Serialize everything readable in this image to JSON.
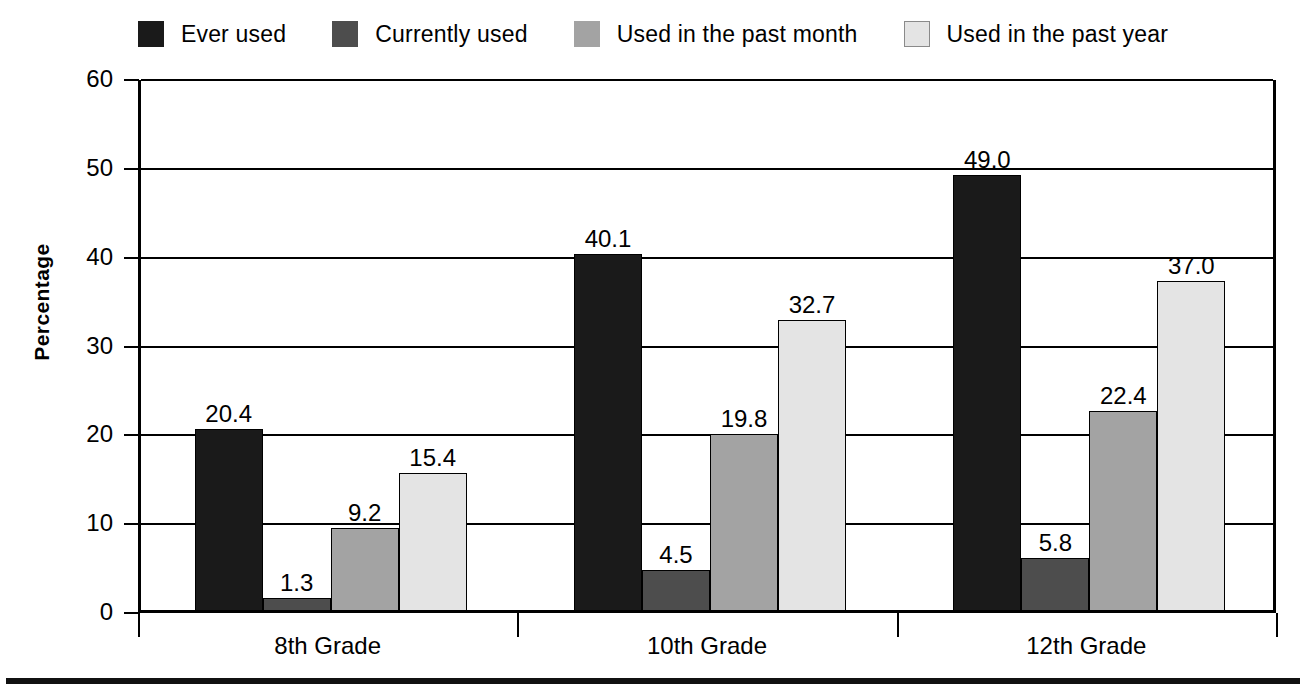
{
  "chart_data": {
    "type": "bar",
    "title": "",
    "xlabel": "",
    "ylabel": "Percentage",
    "ylim": [
      0,
      60
    ],
    "yticks": [
      "0",
      "10",
      "20",
      "30",
      "40",
      "50",
      "60"
    ],
    "grid": true,
    "legend_position": "top",
    "categories": [
      "8th Grade",
      "10th Grade",
      "12th Grade"
    ],
    "series": [
      {
        "name": "Ever used",
        "color": "#1a1a1a",
        "values": [
          20.4,
          40.1,
          49.0
        ],
        "labels": [
          "20.4",
          "40.1",
          "49.0"
        ]
      },
      {
        "name": "Currently used",
        "color": "#4d4d4d",
        "values": [
          1.3,
          4.5,
          5.8
        ],
        "labels": [
          "1.3",
          "4.5",
          "5.8"
        ]
      },
      {
        "name": "Used in the past month",
        "color": "#a3a3a3",
        "values": [
          9.2,
          19.8,
          22.4
        ],
        "labels": [
          "9.2",
          "19.8",
          "22.4"
        ]
      },
      {
        "name": "Used in the past year",
        "color": "#e4e4e4",
        "values": [
          15.4,
          32.7,
          37.0
        ],
        "labels": [
          "15.4",
          "32.7",
          "37.0"
        ]
      }
    ]
  },
  "legend": {
    "items": [
      {
        "label": "Ever used",
        "swatch": "legend-swatch-black"
      },
      {
        "label": "Currently used",
        "swatch": "legend-swatch-dark-gray"
      },
      {
        "label": "Used in the past month",
        "swatch": "legend-swatch-medium-gray"
      },
      {
        "label": "Used in the past year",
        "swatch": "legend-swatch-light-gray"
      }
    ]
  },
  "axes": {
    "y_title": "Percentage",
    "y_ticks": [
      "60",
      "50",
      "40",
      "30",
      "20",
      "10",
      "0"
    ],
    "x_ticks": [
      "8th Grade",
      "10th Grade",
      "12th Grade"
    ]
  }
}
